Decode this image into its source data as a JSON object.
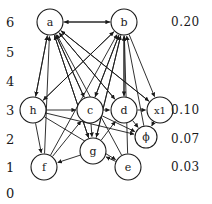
{
  "figure": {
    "type": "directed-graph",
    "width": 212,
    "height": 204,
    "background": "#ffffff",
    "stroke_color": "#1a1a1a"
  },
  "y_axis": {
    "name": "level-axis",
    "ticks": [
      {
        "label": "6",
        "y": 22
      },
      {
        "label": "5",
        "y": 52
      },
      {
        "label": "4",
        "y": 81
      },
      {
        "label": "3",
        "y": 110
      },
      {
        "label": "2",
        "y": 139
      },
      {
        "label": "1",
        "y": 167
      },
      {
        "label": "0",
        "y": 193
      }
    ],
    "x": 6
  },
  "right_values": [
    {
      "label": "0.20",
      "y": 22
    },
    {
      "label": "0.10",
      "y": 110
    },
    {
      "label": "0.07",
      "y": 139
    },
    {
      "label": "0.03",
      "y": 167
    }
  ],
  "right_values_x": 171,
  "nodes": [
    {
      "id": "a",
      "label": "a",
      "cx": 50,
      "cy": 22,
      "r": 13,
      "level": 6
    },
    {
      "id": "b",
      "label": "b",
      "cx": 124,
      "cy": 22,
      "r": 13,
      "level": 6
    },
    {
      "id": "h",
      "label": "h",
      "cx": 33,
      "cy": 110,
      "r": 13,
      "level": 3
    },
    {
      "id": "c",
      "label": "c",
      "cx": 90,
      "cy": 110,
      "r": 13,
      "level": 3
    },
    {
      "id": "d",
      "label": "d",
      "cx": 124,
      "cy": 110,
      "r": 13,
      "level": 3
    },
    {
      "id": "x1",
      "label": "x1",
      "cx": 160,
      "cy": 110,
      "r": 13,
      "level": 3
    },
    {
      "id": "phi",
      "label": "ϕ",
      "cx": 146,
      "cy": 137,
      "r": 11,
      "level": 2
    },
    {
      "id": "f",
      "label": "f",
      "cx": 44,
      "cy": 167,
      "r": 13,
      "level": 1
    },
    {
      "id": "g",
      "label": "g",
      "cx": 93,
      "cy": 151,
      "r": 13,
      "level": 1
    },
    {
      "id": "e",
      "label": "e",
      "cx": 128,
      "cy": 167,
      "r": 13,
      "level": 1
    }
  ],
  "edges": [
    {
      "from": "b",
      "to": "a"
    },
    {
      "from": "a",
      "to": "b"
    },
    {
      "from": "a",
      "to": "h"
    },
    {
      "from": "h",
      "to": "a"
    },
    {
      "from": "c",
      "to": "a"
    },
    {
      "from": "d",
      "to": "a"
    },
    {
      "from": "f",
      "to": "a"
    },
    {
      "from": "g",
      "to": "a"
    },
    {
      "from": "e",
      "to": "a"
    },
    {
      "from": "x1",
      "to": "a"
    },
    {
      "from": "h",
      "to": "b"
    },
    {
      "from": "c",
      "to": "b"
    },
    {
      "from": "d",
      "to": "b"
    },
    {
      "from": "g",
      "to": "b"
    },
    {
      "from": "e",
      "to": "b"
    },
    {
      "from": "f",
      "to": "b"
    },
    {
      "from": "phi",
      "to": "b"
    },
    {
      "from": "b",
      "to": "h"
    },
    {
      "from": "b",
      "to": "c"
    },
    {
      "from": "b",
      "to": "d"
    },
    {
      "from": "b",
      "to": "x1"
    },
    {
      "from": "b",
      "to": "g"
    },
    {
      "from": "a",
      "to": "c"
    },
    {
      "from": "a",
      "to": "d"
    },
    {
      "from": "a",
      "to": "g"
    },
    {
      "from": "a",
      "to": "x1"
    },
    {
      "from": "h",
      "to": "c"
    },
    {
      "from": "c",
      "to": "d"
    },
    {
      "from": "d",
      "to": "x1"
    },
    {
      "from": "h",
      "to": "f"
    },
    {
      "from": "h",
      "to": "phi"
    },
    {
      "from": "h",
      "to": "e"
    },
    {
      "from": "c",
      "to": "g"
    },
    {
      "from": "g",
      "to": "f"
    },
    {
      "from": "e",
      "to": "g"
    },
    {
      "from": "d",
      "to": "phi"
    },
    {
      "from": "c",
      "to": "phi"
    },
    {
      "from": "f",
      "to": "c"
    },
    {
      "from": "g",
      "to": "d"
    },
    {
      "from": "x1",
      "to": "phi"
    }
  ]
}
